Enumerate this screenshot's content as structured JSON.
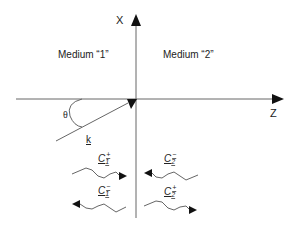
{
  "diagram": {
    "axes": {
      "x_label": "X",
      "z_label": "Z"
    },
    "regions": [
      {
        "label": "Medium “1”"
      },
      {
        "label": "Medium “2”"
      }
    ],
    "incident": {
      "angle_label": "θ",
      "vector_label": "k"
    },
    "waves": [
      {
        "name": "C1+",
        "symbol": "C",
        "subscript": "1",
        "superscript": "+",
        "direction": "right",
        "medium": "1"
      },
      {
        "name": "C1-",
        "symbol": "C",
        "subscript": "1",
        "superscript": "−",
        "direction": "left",
        "medium": "1"
      },
      {
        "name": "C2-",
        "symbol": "C",
        "subscript": "2",
        "superscript": "−",
        "direction": "left",
        "medium": "2"
      },
      {
        "name": "C2+",
        "symbol": "C",
        "subscript": "2",
        "superscript": "+",
        "direction": "right",
        "medium": "2"
      }
    ],
    "colors": {
      "line": "#555555",
      "text": "#222222",
      "background": "#ffffff"
    }
  }
}
